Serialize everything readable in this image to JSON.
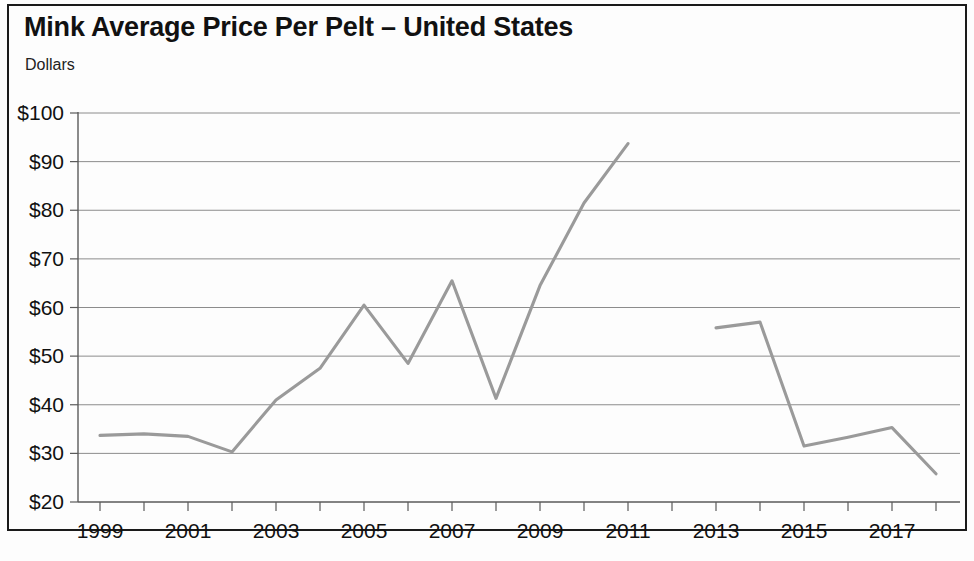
{
  "header": {
    "title": "Mink Average Price Per Pelt – United States",
    "subtitle": "Dollars"
  },
  "chart_data": {
    "type": "line",
    "title": "Mink Average Price Per Pelt – United States",
    "subtitle": "Dollars",
    "xlabel": "",
    "ylabel": "Dollars",
    "xlim": [
      1999,
      2018
    ],
    "ylim": [
      20,
      100
    ],
    "ytick_labels": [
      "$100",
      "$90",
      "$80",
      "$70",
      "$60",
      "$50",
      "$40",
      "$30",
      "$20"
    ],
    "ytick_values": [
      100,
      90,
      80,
      70,
      60,
      50,
      40,
      30,
      20
    ],
    "xtick_labels": [
      "1999",
      "2001",
      "2003",
      "2005",
      "2007",
      "2009",
      "2011",
      "2013",
      "2015",
      "2017"
    ],
    "xtick_values": [
      1999,
      2001,
      2003,
      2005,
      2007,
      2009,
      2011,
      2013,
      2015,
      2017
    ],
    "minor_xticks": [
      2000,
      2002,
      2004,
      2006,
      2008,
      2010,
      2012,
      2014,
      2016,
      2018
    ],
    "grid": "horizontal",
    "legend": "none",
    "line_color": "#9a9a9a",
    "series": [
      {
        "name": "Average price per pelt",
        "x": [
          1999,
          2000,
          2001,
          2002,
          2003,
          2004,
          2005,
          2006,
          2007,
          2008,
          2009,
          2010,
          2011
        ],
        "values": [
          33.7,
          34.0,
          33.5,
          30.3,
          41.0,
          47.5,
          60.5,
          48.5,
          65.5,
          41.3,
          64.5,
          81.5,
          93.7
        ]
      },
      {
        "name": "Average price per pelt (continued)",
        "x": [
          2013,
          2014,
          2015,
          2016,
          2017,
          2018
        ],
        "values": [
          55.8,
          57.0,
          31.5,
          33.3,
          35.3,
          25.8
        ]
      }
    ],
    "gap_years": [
      2012
    ]
  }
}
